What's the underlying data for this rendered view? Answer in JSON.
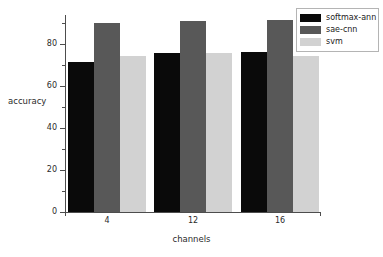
{
  "chart_data": {
    "type": "bar",
    "title": "",
    "subtitle": "",
    "xlabel": "channels",
    "ylabel": "accuracy",
    "categories": [
      "4",
      "12",
      "16"
    ],
    "series": [
      {
        "name": "softmax-ann",
        "color": "#0a0a0a",
        "values": [
          71.5,
          75.5,
          76.0
        ]
      },
      {
        "name": "sae-cnn",
        "color": "#585858",
        "values": [
          90.0,
          91.0,
          91.5
        ]
      },
      {
        "name": "svm",
        "color": "#d2d2d2",
        "values": [
          74.3,
          75.5,
          74.3
        ]
      }
    ],
    "ylim": [
      0,
      95
    ],
    "yticks": [
      0,
      20,
      40,
      60,
      80
    ],
    "ytick_labels": [
      "0",
      "20",
      "40",
      "60",
      "80"
    ],
    "yminor_ticks": [
      10,
      30,
      50,
      70,
      90
    ],
    "grid": false,
    "legend_position": "upper right",
    "legend_entries": [
      "softmax-ann",
      "sae-cnn",
      "svm"
    ],
    "annotations": []
  },
  "axes": {
    "y_title": "accuracy",
    "x_title": "channels"
  }
}
